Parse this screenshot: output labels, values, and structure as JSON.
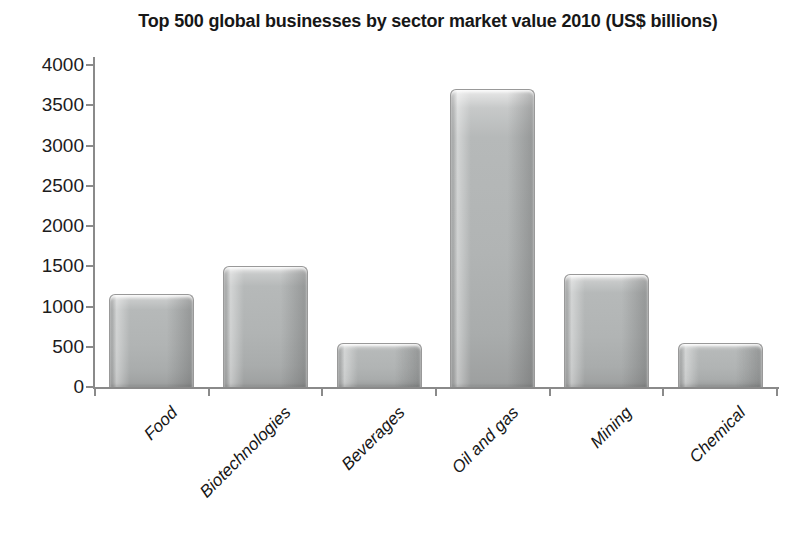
{
  "title": "Top 500 global businesses by sector market value 2010 (US$ billions)",
  "chart_data": {
    "type": "bar",
    "title": "Top 500 global businesses by sector market value 2010 (US$ billions)",
    "categories": [
      "Food",
      "Biotechnologies",
      "Beverages",
      "Oil and gas",
      "Mining",
      "Chemical"
    ],
    "values": [
      1150,
      1500,
      550,
      3700,
      1400,
      550
    ],
    "xlabel": "",
    "ylabel": "",
    "ylim": [
      0,
      4000
    ],
    "yticks": [
      0,
      500,
      1000,
      1500,
      2000,
      2500,
      3000,
      3500,
      4000
    ],
    "grid": false,
    "legend": false,
    "bar_color": "#b1b4b4",
    "axis_color": "#8a8a8a",
    "text_color": "#171717"
  }
}
